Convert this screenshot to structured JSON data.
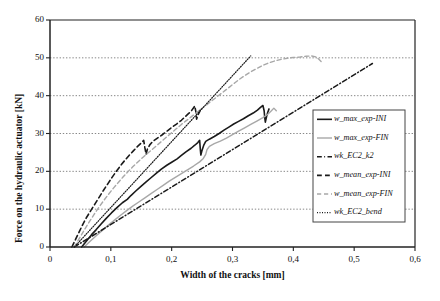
{
  "chart_data": {
    "type": "line",
    "title": "",
    "xlabel": "Width of the cracks [mm]",
    "ylabel": "Force on the hydraulic actuator [kN]",
    "xlim": [
      0,
      0.6
    ],
    "ylim": [
      0,
      60
    ],
    "xticks": [
      "0",
      "0,1",
      "0,2",
      "0,3",
      "0,4",
      "0,5",
      "0,6"
    ],
    "xtick_values": [
      0,
      0.1,
      0.2,
      0.3,
      0.4,
      0.5,
      0.6
    ],
    "yticks": [
      "0",
      "10",
      "20",
      "30",
      "40",
      "50",
      "60"
    ],
    "ytick_values": [
      0,
      10,
      20,
      30,
      40,
      50,
      60
    ],
    "grid": "horizontal-dotted",
    "legend_position": "right-middle",
    "series": [
      {
        "name": "w_max_exp-INI",
        "color": "#1a1a1a",
        "style": "solid",
        "width": 1.6,
        "points": [
          [
            0.052,
            0
          ],
          [
            0.06,
            1.6
          ],
          [
            0.068,
            3.2
          ],
          [
            0.076,
            4.6
          ],
          [
            0.084,
            6.1
          ],
          [
            0.092,
            7.5
          ],
          [
            0.101,
            9.0
          ],
          [
            0.11,
            10.4
          ],
          [
            0.119,
            11.7
          ],
          [
            0.127,
            12.6
          ],
          [
            0.133,
            13.6
          ],
          [
            0.141,
            14.8
          ],
          [
            0.15,
            16.1
          ],
          [
            0.158,
            17.2
          ],
          [
            0.166,
            18.3
          ],
          [
            0.175,
            19.5
          ],
          [
            0.183,
            20.6
          ],
          [
            0.192,
            21.6
          ],
          [
            0.2,
            22.4
          ],
          [
            0.209,
            23.3
          ],
          [
            0.216,
            24.2
          ],
          [
            0.224,
            25.2
          ],
          [
            0.232,
            26.1
          ],
          [
            0.238,
            26.9
          ],
          [
            0.243,
            27.6
          ],
          [
            0.246,
            28.2
          ],
          [
            0.247,
            26.0
          ],
          [
            0.248,
            24.3
          ],
          [
            0.25,
            25.6
          ],
          [
            0.253,
            27.0
          ],
          [
            0.256,
            27.9
          ],
          [
            0.262,
            28.5
          ],
          [
            0.27,
            29.2
          ],
          [
            0.278,
            30.0
          ],
          [
            0.286,
            30.9
          ],
          [
            0.294,
            31.7
          ],
          [
            0.302,
            32.5
          ],
          [
            0.31,
            33.2
          ],
          [
            0.318,
            33.9
          ],
          [
            0.326,
            34.7
          ],
          [
            0.334,
            35.4
          ],
          [
            0.341,
            36.2
          ],
          [
            0.346,
            36.9
          ],
          [
            0.35,
            37.4
          ],
          [
            0.352,
            36.0
          ],
          [
            0.353,
            34.2
          ],
          [
            0.354,
            33.0
          ],
          [
            0.356,
            34.5
          ],
          [
            0.358,
            35.6
          ],
          [
            0.36,
            36.5
          ]
        ]
      },
      {
        "name": "w_max_exp-FIN",
        "color": "#a8a8a8",
        "style": "solid",
        "width": 1.4,
        "points": [
          [
            0.056,
            0
          ],
          [
            0.066,
            1.5
          ],
          [
            0.076,
            3.0
          ],
          [
            0.086,
            4.4
          ],
          [
            0.096,
            5.8
          ],
          [
            0.106,
            7.1
          ],
          [
            0.116,
            8.4
          ],
          [
            0.126,
            9.6
          ],
          [
            0.136,
            10.8
          ],
          [
            0.146,
            11.9
          ],
          [
            0.156,
            13.0
          ],
          [
            0.166,
            14.1
          ],
          [
            0.176,
            15.2
          ],
          [
            0.186,
            16.3
          ],
          [
            0.196,
            17.4
          ],
          [
            0.206,
            18.4
          ],
          [
            0.216,
            19.4
          ],
          [
            0.226,
            20.4
          ],
          [
            0.236,
            21.4
          ],
          [
            0.246,
            22.5
          ],
          [
            0.252,
            23.4
          ],
          [
            0.256,
            24.5
          ],
          [
            0.258,
            25.7
          ],
          [
            0.262,
            26.6
          ],
          [
            0.27,
            27.3
          ],
          [
            0.28,
            28.0
          ],
          [
            0.29,
            28.8
          ],
          [
            0.3,
            29.7
          ],
          [
            0.31,
            30.6
          ],
          [
            0.32,
            31.5
          ],
          [
            0.33,
            32.4
          ],
          [
            0.34,
            33.3
          ],
          [
            0.35,
            34.2
          ],
          [
            0.358,
            35.1
          ],
          [
            0.364,
            36.0
          ],
          [
            0.368,
            36.7
          ],
          [
            0.372,
            36.0
          ]
        ]
      },
      {
        "name": "wk_EC2_k2",
        "color": "#1a1a1a",
        "style": "dashdot",
        "width": 1.5,
        "points": [
          [
            0.04,
            0
          ],
          [
            0.53,
            48.5
          ]
        ]
      },
      {
        "name": "w_mean_exp-INI",
        "color": "#1a1a1a",
        "style": "dashed",
        "width": 1.6,
        "points": [
          [
            0.036,
            0
          ],
          [
            0.042,
            2.0
          ],
          [
            0.048,
            4.0
          ],
          [
            0.054,
            6.0
          ],
          [
            0.06,
            7.8
          ],
          [
            0.067,
            9.6
          ],
          [
            0.074,
            11.4
          ],
          [
            0.081,
            13.2
          ],
          [
            0.088,
            15.0
          ],
          [
            0.095,
            16.7
          ],
          [
            0.102,
            18.4
          ],
          [
            0.109,
            20.0
          ],
          [
            0.116,
            21.5
          ],
          [
            0.123,
            22.9
          ],
          [
            0.13,
            24.2
          ],
          [
            0.137,
            25.4
          ],
          [
            0.144,
            26.6
          ],
          [
            0.15,
            27.5
          ],
          [
            0.154,
            28.2
          ],
          [
            0.156,
            26.2
          ],
          [
            0.158,
            24.5
          ],
          [
            0.16,
            25.8
          ],
          [
            0.164,
            27.0
          ],
          [
            0.169,
            27.9
          ],
          [
            0.176,
            28.7
          ],
          [
            0.184,
            29.6
          ],
          [
            0.192,
            30.6
          ],
          [
            0.2,
            31.6
          ],
          [
            0.208,
            32.5
          ],
          [
            0.216,
            33.5
          ],
          [
            0.222,
            34.4
          ],
          [
            0.228,
            35.3
          ],
          [
            0.233,
            36.1
          ],
          [
            0.236,
            36.8
          ],
          [
            0.238,
            37.3
          ],
          [
            0.24,
            35.5
          ],
          [
            0.241,
            33.8
          ],
          [
            0.243,
            34.8
          ],
          [
            0.246,
            35.8
          ],
          [
            0.248,
            36.6
          ]
        ]
      },
      {
        "name": "w_mean_exp-FIN",
        "color": "#a8a8a8",
        "style": "dashed",
        "width": 1.4,
        "points": [
          [
            0.04,
            0
          ],
          [
            0.048,
            2.2
          ],
          [
            0.056,
            4.4
          ],
          [
            0.064,
            6.5
          ],
          [
            0.072,
            8.5
          ],
          [
            0.08,
            10.4
          ],
          [
            0.088,
            12.2
          ],
          [
            0.096,
            13.9
          ],
          [
            0.104,
            15.5
          ],
          [
            0.112,
            17.0
          ],
          [
            0.12,
            18.5
          ],
          [
            0.128,
            19.9
          ],
          [
            0.136,
            21.2
          ],
          [
            0.144,
            22.4
          ],
          [
            0.152,
            23.6
          ],
          [
            0.16,
            24.7
          ],
          [
            0.168,
            25.8
          ],
          [
            0.176,
            26.9
          ],
          [
            0.184,
            28.0
          ],
          [
            0.192,
            29.1
          ],
          [
            0.2,
            30.2
          ],
          [
            0.208,
            31.3
          ],
          [
            0.216,
            32.4
          ],
          [
            0.224,
            33.4
          ],
          [
            0.232,
            34.4
          ],
          [
            0.24,
            35.4
          ],
          [
            0.248,
            36.4
          ],
          [
            0.256,
            37.4
          ],
          [
            0.264,
            38.4
          ],
          [
            0.272,
            39.4
          ],
          [
            0.28,
            40.4
          ],
          [
            0.288,
            41.4
          ],
          [
            0.296,
            42.4
          ],
          [
            0.304,
            43.4
          ],
          [
            0.312,
            44.4
          ],
          [
            0.32,
            45.3
          ],
          [
            0.33,
            46.3
          ],
          [
            0.34,
            47.2
          ],
          [
            0.35,
            48.0
          ],
          [
            0.36,
            48.7
          ],
          [
            0.37,
            49.2
          ],
          [
            0.38,
            49.6
          ],
          [
            0.39,
            49.9
          ],
          [
            0.4,
            50.1
          ],
          [
            0.41,
            50.2
          ],
          [
            0.42,
            50.4
          ],
          [
            0.43,
            50.5
          ],
          [
            0.438,
            50.2
          ],
          [
            0.442,
            49.6
          ],
          [
            0.446,
            49.0
          ]
        ]
      },
      {
        "name": "wk_EC2_bend",
        "color": "#1a1a1a",
        "style": "dotted",
        "width": 1.2,
        "points": [
          [
            0.04,
            0
          ],
          [
            0.33,
            50.5
          ]
        ]
      }
    ]
  },
  "legend": {
    "items": [
      {
        "label": "w_max_exp-INI"
      },
      {
        "label": "w_max_exp-FIN"
      },
      {
        "label": "wk_EC2_k2"
      },
      {
        "label": "w_mean_exp-INI"
      },
      {
        "label": "w_mean_exp-FIN"
      },
      {
        "label": "wk_EC2_bend"
      }
    ]
  }
}
